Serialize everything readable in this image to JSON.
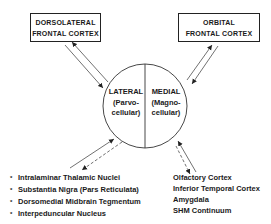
{
  "boxes": {
    "dorsolateral": {
      "line1": "DORSOLATERAL",
      "line2": "FRONTAL CORTEX"
    },
    "orbital": {
      "line1": "ORBITAL",
      "line2": "FRONTAL CORTEX"
    }
  },
  "circle": {
    "lateral": {
      "title": "LATERAL",
      "line2": "(Parvo-",
      "line3": "cellular)"
    },
    "medial": {
      "title": "MEDIAL",
      "line2": "(Magno-",
      "line3": "cellular)"
    }
  },
  "left_list": {
    "bullet": "*",
    "items": [
      "Intralaminar Thalamic Nuclei",
      "Substantia Nigra (Pars Reticulata)",
      "Dorsomedial Midbrain Tegmentum",
      "Interpeduncular Nucleus"
    ]
  },
  "right_list": {
    "items": [
      "Olfactory Cortex",
      "Inferior Temporal Cortex",
      "Amygdala",
      "SHM Continuum"
    ]
  }
}
